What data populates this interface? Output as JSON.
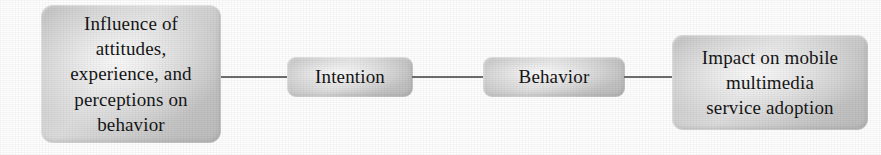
{
  "figure": {
    "type": "flow-diagram",
    "orientation": "left-to-right",
    "background_color": "#ffffff",
    "node_fill_color": "#d2d2d2",
    "node_text_color": "#151515",
    "connector_color": "#6f6f6f"
  },
  "nodes": [
    {
      "id": "antecedents",
      "label": "Influence of\nattitudes,\nexperience, and\nperceptions on\nbehavior",
      "shape": "rounded-rectangle"
    },
    {
      "id": "intention",
      "label": "Intention",
      "shape": "rounded-rectangle"
    },
    {
      "id": "behavior",
      "label": "Behavior",
      "shape": "rounded-rectangle"
    },
    {
      "id": "outcome",
      "label": "Impact on mobile\nmultimedia\nservice adoption",
      "shape": "rounded-rectangle"
    }
  ],
  "connectors": [
    {
      "id": "connector-1",
      "from": "antecedents",
      "to": "intention",
      "style": "plain-line"
    },
    {
      "id": "connector-2",
      "from": "intention",
      "to": "behavior",
      "style": "plain-line"
    },
    {
      "id": "connector-3",
      "from": "behavior",
      "to": "outcome",
      "style": "plain-line"
    }
  ]
}
